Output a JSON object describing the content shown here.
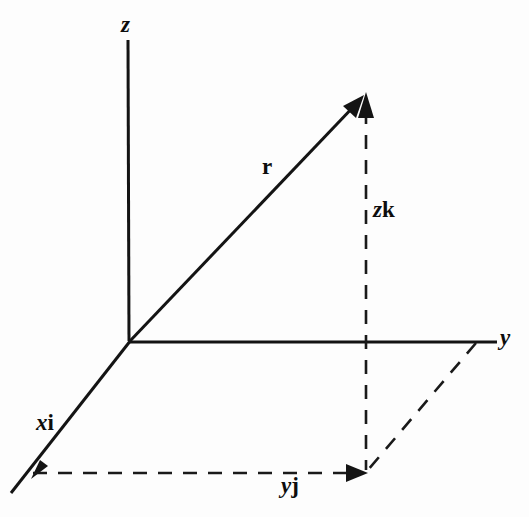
{
  "figure": {
    "background_color": "#fdfdfd",
    "ink_color": "#141414"
  },
  "axes": [
    {
      "name": "z-axis",
      "label": "z",
      "label_style": "italic",
      "from": [
        130,
        341
      ],
      "to": [
        128,
        40
      ],
      "label_position": [
        121,
        14
      ]
    },
    {
      "name": "y-axis",
      "label": "y",
      "label_style": "italic",
      "from": [
        130,
        341
      ],
      "to": [
        497,
        342
      ],
      "label_position": [
        500,
        327
      ]
    },
    {
      "name": "x-axis",
      "label": "",
      "label_style": "italic",
      "from": [
        130,
        341
      ],
      "to": [
        11,
        493
      ],
      "label_position": [
        0,
        0
      ]
    }
  ],
  "vectors": [
    {
      "name": "position-vector-r",
      "label": "r",
      "label_style": "bold-upright",
      "from": [
        130,
        341
      ],
      "to": [
        363,
        96
      ],
      "label_position": [
        262,
        156
      ],
      "arrow": true
    },
    {
      "name": "x-component-vector",
      "label_scalar": "x",
      "label_unit": "i",
      "label": "xi",
      "from": [
        130,
        341
      ],
      "to": [
        33,
        476
      ],
      "label_position": [
        36,
        412
      ],
      "arrow": true
    },
    {
      "name": "y-component-vector",
      "label_scalar": "y",
      "label_unit": "j",
      "label": "yj",
      "from": [
        33,
        473
      ],
      "to": [
        366,
        473
      ],
      "label_position": [
        281,
        474
      ],
      "arrow": true
    },
    {
      "name": "z-component-vector",
      "label_scalar": "z",
      "label_unit": "k",
      "label": "zk",
      "from": [
        366,
        473
      ],
      "to": [
        366,
        100
      ],
      "label_position": [
        373,
        198
      ],
      "arrow": true
    }
  ],
  "construction_lines": [
    {
      "name": "projection-line-parallel-to-x",
      "from": [
        475,
        343
      ],
      "to": [
        367,
        471
      ],
      "style": "dashed"
    }
  ],
  "labels": {
    "z_axis": "z",
    "y_axis": "y",
    "r_vector": "r",
    "x_component_scalar": "x",
    "x_component_unit": "i",
    "y_component_scalar": "y",
    "y_component_unit": "j",
    "z_component_scalar": "z",
    "z_component_unit": "k"
  }
}
